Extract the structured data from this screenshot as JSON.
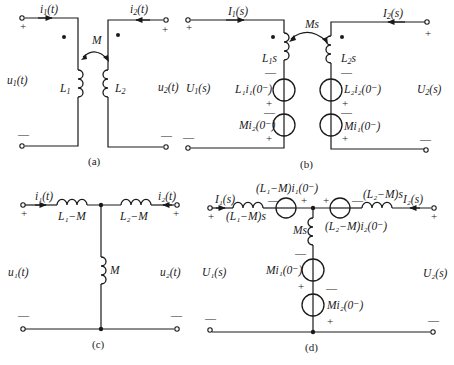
{
  "figure": {
    "colors": {
      "ink": "#1a1a1a",
      "background": "#ffffff"
    }
  },
  "panel_a": {
    "caption": "(a)",
    "current_left": "i",
    "current_left_sub": "1",
    "current_left_arg": "(t)",
    "current_right": "i",
    "current_right_sub": "2",
    "current_right_arg": "(t)",
    "voltage_left": "u",
    "voltage_left_sub": "1",
    "voltage_left_arg": "(t)",
    "voltage_right": "u",
    "voltage_right_sub": "2",
    "voltage_right_arg": "(t)",
    "mutual": "M",
    "inductor_left": "L",
    "inductor_left_sub": "1",
    "inductor_right": "L",
    "inductor_right_sub": "2",
    "plus": "+",
    "minus": "—"
  },
  "panel_b": {
    "caption": "(b)",
    "current_left": "I",
    "current_left_sub": "1",
    "current_left_arg": "(s)",
    "current_right": "I",
    "current_right_sub": "2",
    "current_right_arg": "(s)",
    "voltage_left": "U",
    "voltage_left_sub": "1",
    "voltage_left_arg": "(s)",
    "voltage_right": "U",
    "voltage_right_sub": "2",
    "voltage_right_arg": "(s)",
    "mutual": "Ms",
    "inductor_left": "L",
    "inductor_left_sub": "1",
    "inductor_left_s": "s",
    "inductor_right": "L",
    "inductor_right_sub": "2",
    "inductor_right_s": "s",
    "src_left_1": "L₁i₁(0⁻)",
    "src_left_2": "Mi₂(0⁻)",
    "src_right_1": "L₂i₂(0⁻)",
    "src_right_2": "Mi₁(0⁻)",
    "plus": "+",
    "minus": "—"
  },
  "panel_c": {
    "caption": "(c)",
    "current_left": "i₁(t)",
    "current_right": "i₂(t)",
    "voltage_left": "u₁(t)",
    "voltage_right": "u₂(t)",
    "inductor_left": "L₁−M",
    "inductor_right": "L₂−M",
    "inductor_shunt": "M",
    "plus": "+",
    "minus": "—"
  },
  "panel_d": {
    "caption": "(d)",
    "current_left": "I₁(s)",
    "current_right": "I₂(s)",
    "voltage_left": "U₁(s)",
    "voltage_right": "U₂(s)",
    "imp_left": "(L₁−M)s",
    "imp_right": "(L₂−M)s",
    "imp_shunt": "Ms",
    "src_left": "(L₁−M)i₁(0⁻)",
    "src_right": "(L₂−M)i₂(0⁻)",
    "src_shunt_1": "Mi₁(0⁻)",
    "src_shunt_2": "Mi₂(0⁻)",
    "plus": "+",
    "minus": "—"
  }
}
